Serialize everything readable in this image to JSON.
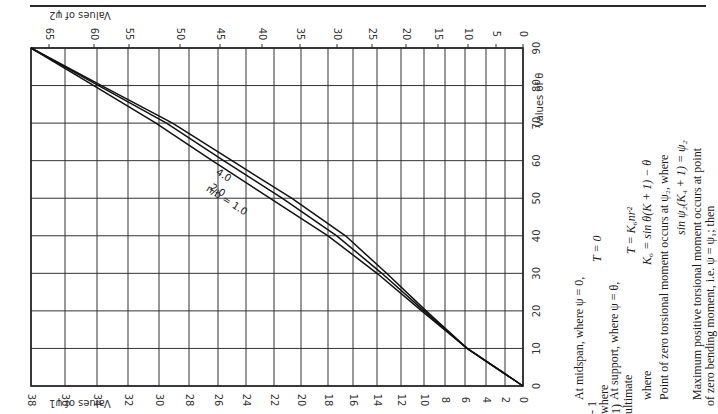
{
  "page": {
    "orientation": "rotated-90"
  },
  "chart_data": {
    "type": "line",
    "title": "",
    "xlabel_bottom": "Values of ψ1",
    "xlabel_top": "Values of ψ2",
    "ylabel": "Values of θ",
    "theta_ticks": [
      0,
      10,
      20,
      30,
      40,
      50,
      60,
      70,
      80,
      90
    ],
    "psi1_ticks": [
      38,
      36,
      34,
      32,
      30,
      28,
      26,
      24,
      22,
      20,
      18,
      16,
      14,
      12,
      10,
      8,
      6,
      4,
      2,
      0
    ],
    "psi2_ticks": [
      65,
      60,
      55,
      50,
      45,
      40,
      35,
      30,
      25,
      20,
      15,
      10,
      5,
      0
    ],
    "ylim": [
      0,
      90
    ],
    "grid": true,
    "series": [
      {
        "name": "n/b = 1.0",
        "label": "n/b = 1.0",
        "theta": [
          0,
          10,
          20,
          30,
          40,
          50,
          60,
          70,
          80,
          90
        ],
        "psi1": [
          0,
          5.8,
          10.2,
          14.0,
          18.0,
          22.3,
          26.4,
          30.2,
          34.2,
          38
        ]
      },
      {
        "name": "2.0",
        "label": "2.0",
        "theta": [
          0,
          10,
          20,
          30,
          40,
          50,
          60,
          70,
          80,
          90
        ],
        "psi1": [
          0,
          5.8,
          10.0,
          13.6,
          17.3,
          21.4,
          25.6,
          29.5,
          33.9,
          38
        ]
      },
      {
        "name": "4.0",
        "label": "4.0",
        "theta": [
          0,
          10,
          20,
          30,
          40,
          50,
          60,
          70,
          80,
          90
        ],
        "psi1": [
          0,
          5.8,
          9.8,
          13.2,
          16.6,
          20.7,
          25.0,
          29.1,
          33.7,
          38
        ]
      }
    ]
  },
  "text": {
    "left_fragments": [
      "- 1",
      "where",
      "1)",
      "ultimate"
    ],
    "midspan": "At midspan, where ψ = 0,",
    "t_zero": "T = 0",
    "support": "At support, where ψ = θ,",
    "t_support": "T = K₆nr²",
    "where": "where",
    "k6": "K₆ = sin θ(K + 1) − θ",
    "zero_torsion": "Point of zero torsional moment occurs at ψ₂, where",
    "sin_eq": "sin ψ₂(K₄ + 1) = ψ₂",
    "max_pos_1": "Maximum positive torsional moment occurs at point",
    "max_pos_2": "of zero bending moment, i.e. ψ = ψ₁; then"
  }
}
